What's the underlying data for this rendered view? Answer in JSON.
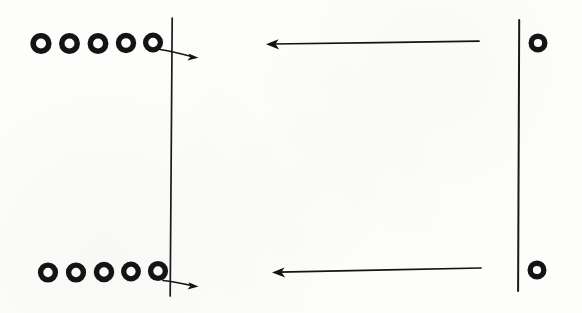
{
  "figure": {
    "background_color": "#fdfdfb",
    "ink_color": "#141414",
    "width": 582,
    "height": 313
  },
  "rows": [
    {
      "id": "top-row",
      "y": 43,
      "left_cluster": {
        "label": "five rings",
        "count": 5,
        "first_cx": 41,
        "spacing": 28.5,
        "radius_outer": 10.5,
        "stroke_width": 5.5
      },
      "left_barrier": {
        "label": "left vertical barrier (shared)",
        "x_top": 172,
        "x_bottom": 170,
        "y_top": 18,
        "y_bottom": 296
      },
      "outward_arrow": {
        "label": "rightward arrow crossing left barrier",
        "direction": "right",
        "x_start": 160,
        "y_start": 50,
        "x_end": 198,
        "y_end": 57
      },
      "inward_arrow": {
        "label": "long leftward arrow",
        "direction": "left",
        "x_start": 479,
        "y_start": 41,
        "x_end": 266,
        "y_end": 44
      },
      "right_barrier": {
        "label": "right vertical barrier (shared)",
        "x_top": 519,
        "x_bottom": 518,
        "y_top": 20,
        "y_bottom": 291
      },
      "right_ring": {
        "label": "single ring",
        "count": 1,
        "cx": 538,
        "cy": 43,
        "radius_outer": 9.5,
        "stroke_width": 5.5
      }
    },
    {
      "id": "bottom-row",
      "y": 272,
      "left_cluster": {
        "label": "five rings",
        "count": 5,
        "first_cx": 48,
        "spacing": 28.5,
        "radius_outer": 10,
        "stroke_width": 5.5
      },
      "outward_arrow": {
        "label": "rightward arrow crossing left barrier",
        "direction": "right",
        "x_start": 163,
        "y_start": 281,
        "x_end": 198,
        "y_end": 286
      },
      "inward_arrow": {
        "label": "long leftward arrow",
        "direction": "left",
        "x_start": 481,
        "y_start": 268,
        "x_end": 272,
        "y_end": 272
      },
      "right_ring": {
        "label": "single ring",
        "count": 1,
        "cx": 537,
        "cy": 270,
        "radius_outer": 9.5,
        "stroke_width": 5.5
      }
    }
  ]
}
